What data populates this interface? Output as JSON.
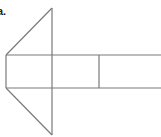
{
  "figure": {
    "label": "a.",
    "stroke_color": "#7a7a7a",
    "background": "#ffffff"
  }
}
